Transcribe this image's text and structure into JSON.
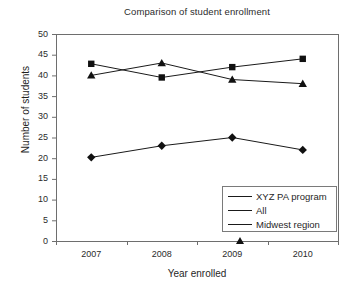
{
  "chart_data": {
    "type": "line",
    "title": "Comparison of student enrollment",
    "xlabel": "Year enrolled",
    "ylabel": "Number of students",
    "categories": [
      "2007",
      "2008",
      "2009",
      "2010"
    ],
    "x": [
      2007,
      2008,
      2009,
      2010
    ],
    "ylim": [
      0,
      50
    ],
    "yticks": [
      0,
      5,
      10,
      15,
      20,
      25,
      30,
      35,
      40,
      45,
      50
    ],
    "ytick_labels": [
      "0",
      "5",
      "10",
      "15",
      "20",
      "25",
      "30",
      "35",
      "40",
      "45",
      "50"
    ],
    "grid": false,
    "legend_position": "lower right",
    "series": [
      {
        "name": "XYZ PA program",
        "marker": "diamond",
        "color": "#111111",
        "values": [
          20.2,
          23,
          25,
          22
        ]
      },
      {
        "name": "All",
        "marker": "square",
        "color": "#111111",
        "values": [
          42.8,
          39.5,
          42,
          44
        ]
      },
      {
        "name": "Midwest region",
        "marker": "triangle",
        "color": "#111111",
        "values": [
          40,
          43,
          39,
          38
        ]
      }
    ]
  },
  "axes": {
    "frame_color": "#6e6e6e",
    "line_color": "#1a1a1a"
  }
}
